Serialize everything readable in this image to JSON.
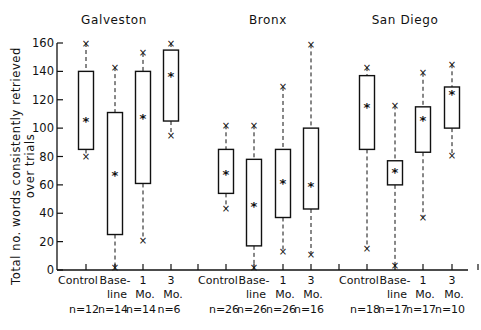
{
  "chart_data": {
    "type": "box",
    "ylabel": "Total no. words consistently retrieved over trials",
    "ylabel_line1": "Total no. words consistently retrieved",
    "ylabel_line2": "over trials",
    "ylim": [
      0,
      160
    ],
    "yticks": [
      0,
      20,
      40,
      60,
      80,
      100,
      120,
      140,
      160
    ],
    "panels": [
      {
        "title": "Galveston",
        "groups": [
          {
            "label": "Control",
            "label2": "",
            "n": "n=12",
            "min": 80,
            "q1": 85,
            "mean": 105,
            "q3": 140,
            "max": 160
          },
          {
            "label": "Base-",
            "label2": "line",
            "n": "n=14",
            "min": 2,
            "q1": 25,
            "mean": 67,
            "q3": 111,
            "max": 143
          },
          {
            "label": "1",
            "label2": "Mo.",
            "n": "n=14",
            "min": 21,
            "q1": 61,
            "mean": 107,
            "q3": 140,
            "max": 153
          },
          {
            "label": "3",
            "label2": "Mo.",
            "n": "n=6",
            "min": 95,
            "q1": 105,
            "mean": 137,
            "q3": 155,
            "max": 160
          }
        ]
      },
      {
        "title": "Bronx",
        "groups": [
          {
            "label": "Control",
            "label2": "",
            "n": "n=26",
            "min": 43,
            "q1": 54,
            "mean": 68,
            "q3": 85,
            "max": 102
          },
          {
            "label": "Base-",
            "label2": "line",
            "n": "n=26",
            "min": 2,
            "q1": 17,
            "mean": 45,
            "q3": 78,
            "max": 102
          },
          {
            "label": "1",
            "label2": "Mo.",
            "n": "n=26",
            "min": 13,
            "q1": 37,
            "mean": 61,
            "q3": 85,
            "max": 129
          },
          {
            "label": "3",
            "label2": "Mo.",
            "n": "n=16",
            "min": 11,
            "q1": 43,
            "mean": 59,
            "q3": 100,
            "max": 159
          }
        ]
      },
      {
        "title": "San Diego",
        "groups": [
          {
            "label": "Control",
            "label2": "",
            "n": "n=18",
            "min": 15,
            "q1": 85,
            "mean": 115,
            "q3": 137,
            "max": 143
          },
          {
            "label": "Base-",
            "label2": "line",
            "n": "n=17",
            "min": 3,
            "q1": 60,
            "mean": 69,
            "q3": 77,
            "max": 116
          },
          {
            "label": "1",
            "label2": "Mo.",
            "n": "n=17",
            "min": 37,
            "q1": 83,
            "mean": 106,
            "q3": 115,
            "max": 139
          },
          {
            "label": "3",
            "label2": "Mo.",
            "n": "n=10",
            "min": 81,
            "q1": 100,
            "mean": 124,
            "q3": 129,
            "max": 145
          }
        ]
      }
    ]
  }
}
